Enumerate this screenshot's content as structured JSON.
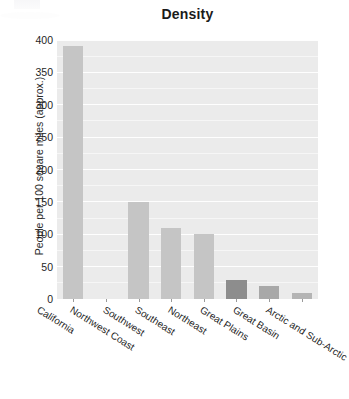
{
  "chart_data": {
    "type": "bar",
    "title": "Density",
    "xlabel": "",
    "ylabel": "People per 100 square miles (approx.)",
    "categories": [
      "California",
      "Northwest Coast",
      "Southwest",
      "Southeast",
      "Northeast",
      "Great Plains",
      "Great Basin",
      "Arctic and Sub-Arctic"
    ],
    "values": [
      390,
      0,
      150,
      110,
      100,
      30,
      20,
      10
    ],
    "ylim": [
      0,
      400
    ],
    "yticks": [
      0,
      50,
      100,
      150,
      200,
      250,
      300,
      350,
      400
    ],
    "ytick_labels": [
      "0",
      "50",
      "100",
      "150",
      "200",
      "250",
      "300",
      "350",
      "400"
    ],
    "grid": true,
    "grid_axis": "y",
    "legend": false,
    "bar_colors": [
      "#c5c5c5",
      "#c5c5c5",
      "#c5c5c5",
      "#c5c5c5",
      "#c5c5c5",
      "#8d8d8d",
      "#a8a8a8",
      "#b4b4b4"
    ],
    "panel_background": "#ebebeb",
    "gridline_color": "#ffffff",
    "figure_background": "#ffffff",
    "text_color": "#1f1f1f"
  }
}
